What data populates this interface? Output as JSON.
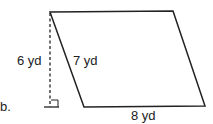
{
  "problem": {
    "label": "b.",
    "shape": "parallelogram",
    "height_label": "6 yd",
    "side_label": "7 yd",
    "base_label": "8 yd"
  }
}
